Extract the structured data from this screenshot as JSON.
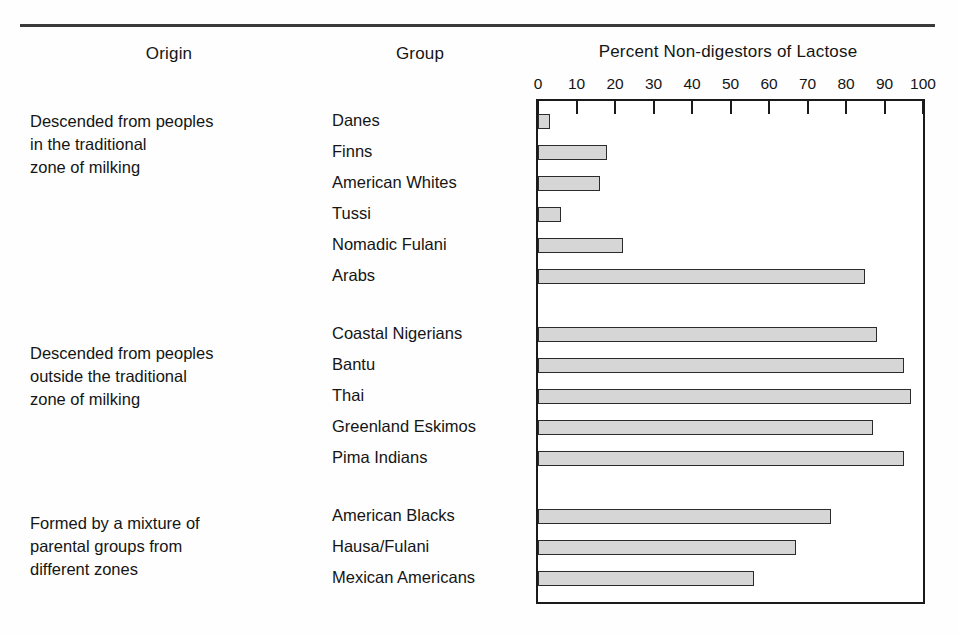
{
  "figure": {
    "columns": {
      "origin_header": "Origin",
      "group_header": "Group",
      "axis_title": "Percent Non-digestors of Lactose"
    },
    "origin_blocks": [
      [
        "Descended from peoples",
        "in the traditional",
        "zone of milking"
      ],
      [
        "Descended from peoples",
        "outside the traditional",
        "zone of milking"
      ],
      [
        "Formed by a mixture of",
        "parental groups from",
        "different zones"
      ]
    ]
  },
  "chart_data": {
    "type": "bar",
    "orientation": "horizontal",
    "title": "Percent Non-digestors of Lactose",
    "xlabel": "Percent Non-digestors of Lactose",
    "ylabel": "Group",
    "xlim": [
      0,
      100
    ],
    "xticks": [
      0,
      10,
      20,
      30,
      40,
      50,
      60,
      70,
      80,
      90,
      100
    ],
    "grid": false,
    "legend": false,
    "bar_fill_color": "#d6d6d6",
    "bar_edge_color": "#2b2b2b",
    "categories": [
      "Danes",
      "Finns",
      "American Whites",
      "Tussi",
      "Nomadic Fulani",
      "Arabs",
      "Coastal Nigerians",
      "Bantu",
      "Thai",
      "Greenland Eskimos",
      "Pima Indians",
      "American Blacks",
      "Hausa/Fulani",
      "Mexican Americans"
    ],
    "values": [
      3,
      18,
      16,
      6,
      22,
      85,
      88,
      95,
      97,
      87,
      95,
      76,
      67,
      56
    ],
    "groups": [
      {
        "origin": "Descended from peoples in the traditional zone of milking",
        "categories": [
          "Danes",
          "Finns",
          "American Whites",
          "Tussi",
          "Nomadic Fulani",
          "Arabs"
        ],
        "values": [
          3,
          18,
          16,
          6,
          22,
          85
        ]
      },
      {
        "origin": "Descended from peoples outside the traditional zone of milking",
        "categories": [
          "Coastal Nigerians",
          "Bantu",
          "Thai",
          "Greenland Eskimos",
          "Pima Indians"
        ],
        "values": [
          88,
          95,
          97,
          87,
          95
        ]
      },
      {
        "origin": "Formed by a mixture of parental groups from different zones",
        "categories": [
          "American Blacks",
          "Hausa/Fulani",
          "Mexican Americans"
        ],
        "values": [
          76,
          67,
          56
        ]
      }
    ]
  }
}
